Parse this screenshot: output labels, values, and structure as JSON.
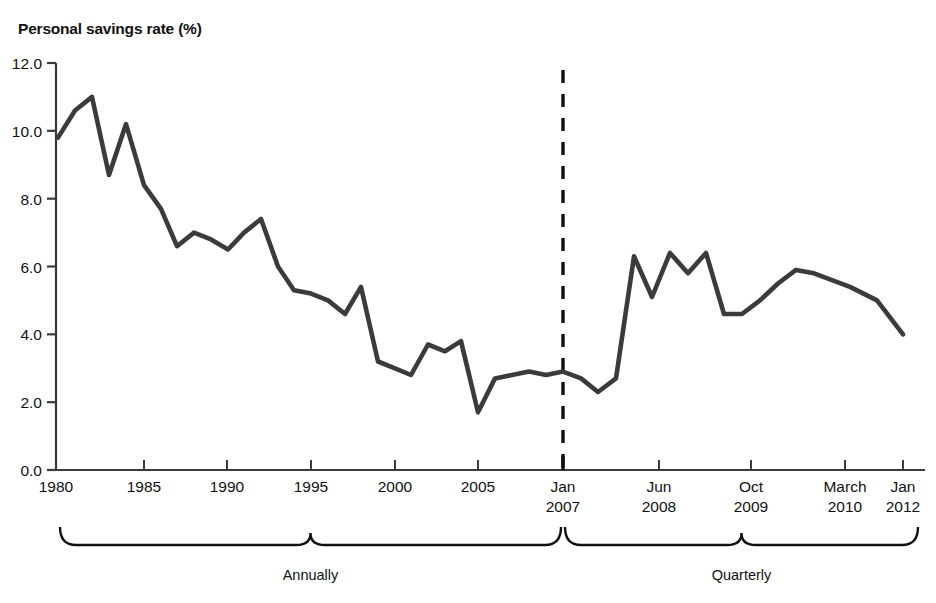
{
  "chart_data": {
    "type": "line",
    "title": "Personal savings rate (%)",
    "xlabel": "",
    "ylabel": "",
    "ylim": [
      0.0,
      12.0
    ],
    "yticks": [
      "0.0",
      "2.0",
      "4.0",
      "6.0",
      "8.0",
      "10.0",
      "12.0"
    ],
    "ytick_values": [
      0.0,
      2.0,
      4.0,
      6.0,
      8.0,
      10.0,
      12.0
    ],
    "grid": false,
    "legend": "none",
    "line_color": "#3b3b3b",
    "axis_color": "#3b3b3b",
    "xticks": [
      {
        "label": "1980",
        "sublabel": "",
        "x_px": 56
      },
      {
        "label": "1985",
        "sublabel": "",
        "x_px": 144
      },
      {
        "label": "1990",
        "sublabel": "",
        "x_px": 227
      },
      {
        "label": "1995",
        "sublabel": "",
        "x_px": 311
      },
      {
        "label": "2000",
        "sublabel": "",
        "x_px": 395
      },
      {
        "label": "2005",
        "sublabel": "",
        "x_px": 478
      },
      {
        "label": "Jan",
        "sublabel": "2007",
        "x_px": 563
      },
      {
        "label": "Jun",
        "sublabel": "2008",
        "x_px": 659
      },
      {
        "label": "Oct",
        "sublabel": "2009",
        "x_px": 751
      },
      {
        "label": "March",
        "sublabel": "2010",
        "x_px": 845
      },
      {
        "label": "Jan",
        "sublabel": "2012",
        "x_px": 903
      }
    ],
    "annotations": [
      {
        "name": "frequency-divider",
        "type": "dashed-vline",
        "x_px": 563,
        "label": ""
      },
      {
        "name": "annually-brace",
        "type": "brace",
        "label": "Annually",
        "x_start_px": 60,
        "x_end_px": 561
      },
      {
        "name": "quarterly-brace",
        "type": "brace",
        "label": "Quarterly",
        "x_start_px": 565,
        "x_end_px": 918
      }
    ],
    "segments": [
      {
        "name": "annual",
        "frequency": "Annually",
        "x_labels": [
          "1980",
          "1981",
          "1982",
          "1983",
          "1984",
          "1985",
          "1986",
          "1987",
          "1988",
          "1989",
          "1990",
          "1991",
          "1992",
          "1993",
          "1994",
          "1995",
          "1996",
          "1997",
          "1998",
          "1999",
          "2000",
          "2001",
          "2002",
          "2003",
          "2004",
          "2005",
          "2006"
        ],
        "x_px": [
          58,
          75,
          92,
          109,
          126,
          144,
          161,
          177,
          194,
          211,
          228,
          244,
          261,
          278,
          294,
          311,
          328,
          345,
          361,
          378,
          395,
          411,
          428,
          445,
          461,
          478,
          495
        ],
        "values": [
          9.8,
          10.6,
          11.0,
          8.7,
          10.2,
          8.4,
          7.7,
          6.6,
          7.0,
          6.8,
          6.5,
          7.0,
          7.4,
          6.0,
          5.3,
          5.2,
          5.0,
          4.6,
          5.4,
          3.2,
          3.0,
          2.8,
          3.7,
          3.5,
          3.8,
          1.7,
          2.7
        ]
      },
      {
        "name": "quarterly",
        "frequency": "Quarterly",
        "x_labels": [
          "Q 2006",
          "Jan 2007",
          "Q2 2007",
          "Q3 2007",
          "Q4 2007",
          "Q1 2008",
          "Jun 2008",
          "Q3 2008",
          "Q4 2008",
          "Q1 2009",
          "Q2 2009",
          "Oct 2009",
          "Q4 2009",
          "Q1 2010",
          "March 2010",
          "Q3 2010",
          "Q4 2010",
          "Q1 2011",
          "Q2 2011",
          "Q3 2011",
          "Q4 2011",
          "Jan 2012"
        ],
        "x_px": [
          512,
          529,
          546,
          563,
          581,
          598,
          616,
          634,
          652,
          670,
          688,
          706,
          724,
          742,
          760,
          778,
          796,
          814,
          832,
          850,
          877,
          903
        ],
        "values": [
          2.8,
          2.9,
          2.8,
          2.9,
          2.7,
          2.3,
          2.7,
          6.3,
          5.1,
          6.4,
          5.8,
          6.4,
          4.6,
          4.6,
          5.0,
          5.5,
          5.9,
          5.8,
          5.6,
          5.4,
          5.0,
          4.0
        ]
      }
    ]
  },
  "axis": {
    "y_top_label": "12.0",
    "y_bottom_label": "0.0"
  }
}
